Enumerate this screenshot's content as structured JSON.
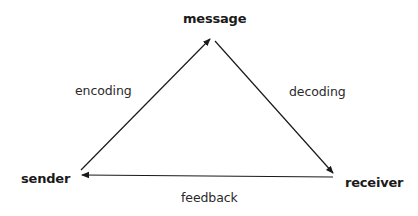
{
  "diagram": {
    "type": "communication-triangle",
    "nodes": [
      {
        "id": "message",
        "label": "message"
      },
      {
        "id": "sender",
        "label": "sender"
      },
      {
        "id": "receiver",
        "label": "receiver"
      }
    ],
    "edges": [
      {
        "from": "sender",
        "to": "message",
        "label": "encoding"
      },
      {
        "from": "message",
        "to": "receiver",
        "label": "decoding"
      },
      {
        "from": "receiver",
        "to": "sender",
        "label": "feedback"
      }
    ],
    "colors": {
      "line": "#1a1a1a",
      "text": "#1a1a1a",
      "background": "#ffffff"
    }
  }
}
